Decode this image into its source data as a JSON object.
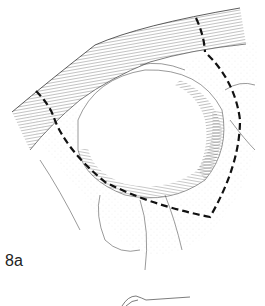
{
  "figure": {
    "label": "8a",
    "colors": {
      "background": "#ffffff",
      "ink": "#1a1a1a",
      "dash": "#111111"
    }
  }
}
